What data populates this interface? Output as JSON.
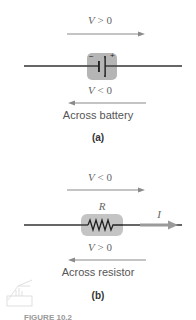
{
  "panel_a": {
    "top_label_var": "V",
    "top_label_rel": " > 0",
    "bottom_label_var": "V",
    "bottom_label_rel": " < 0",
    "caption": "Across battery",
    "sublabel": "(a)",
    "battery_minus": "−",
    "battery_plus": "+"
  },
  "panel_b": {
    "top_label_var": "V",
    "top_label_rel": " < 0",
    "bottom_label_var": "V",
    "bottom_label_rel": " > 0",
    "resistor_label": "R",
    "current_label": "I",
    "caption": "Across resistor",
    "sublabel": "(b)"
  },
  "footer_text": "FIGURE 10.2",
  "colors": {
    "arrow": "#8a8a8a",
    "wire": "#333333",
    "component_bg": "#b5b5b5"
  }
}
